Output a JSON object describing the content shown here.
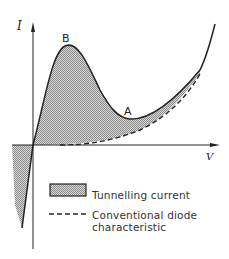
{
  "diagram": {
    "axes": {
      "y_label": "I",
      "x_label": "V"
    },
    "points": {
      "peak": "B",
      "valley": "A"
    },
    "legend": {
      "shaded_label": "Tunnelling current",
      "dashed_label_line1": "Conventional diode",
      "dashed_label_line2": "characteristic"
    },
    "colors": {
      "line": "#222222",
      "hatch": "#9a9a9a",
      "background": "#ffffff"
    }
  }
}
